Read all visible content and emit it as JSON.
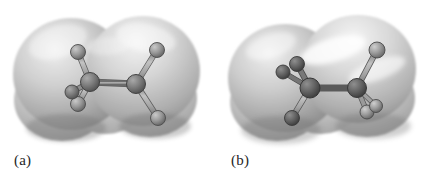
{
  "figure": {
    "background_color": "#ffffff",
    "width": 434,
    "height": 174,
    "kind": "molecular-structure-illustration"
  },
  "panels": [
    {
      "id": "a",
      "caption": "(a)",
      "conformation": "anti",
      "surface": {
        "fill_light": "#e9e9e9",
        "fill_mid": "#bdbdbd",
        "fill_dark": "#8f8f8f",
        "edge_color": "#a6a6a6",
        "lobes": [
          {
            "cx": 72,
            "cy": 75,
            "rx": 58,
            "ry": 56
          },
          {
            "cx": 142,
            "cy": 72,
            "rx": 58,
            "ry": 56
          },
          {
            "cx": 62,
            "cy": 100,
            "rx": 48,
            "ry": 40
          },
          {
            "cx": 150,
            "cy": 98,
            "rx": 46,
            "ry": 38
          },
          {
            "cx": 106,
            "cy": 86,
            "rx": 44,
            "ry": 46
          }
        ]
      },
      "model": {
        "atom_fill": "#8c8c8c",
        "atom_fill_dark": "#6e6e6e",
        "atom_edge": "#4c4c4c",
        "bond_fill": "#a8a8a8",
        "bond_edge": "#6b6b6b",
        "atoms": [
          {
            "name": "carbon-left",
            "x": 90,
            "y": 82,
            "r": 9.5,
            "shade": "dark"
          },
          {
            "name": "carbon-right",
            "x": 136,
            "y": 84,
            "r": 9.5,
            "shade": "dark"
          },
          {
            "name": "hydrogen-upper-left",
            "x": 78,
            "y": 52,
            "r": 7.5,
            "shade": "light"
          },
          {
            "name": "hydrogen-lower-left",
            "x": 78,
            "y": 104,
            "r": 7.5,
            "shade": "light"
          },
          {
            "name": "hydrogen-front-left",
            "x": 72,
            "y": 92,
            "r": 7.0,
            "shade": "dark"
          },
          {
            "name": "hydrogen-upper-right",
            "x": 157,
            "y": 50,
            "r": 7.5,
            "shade": "light"
          },
          {
            "name": "hydrogen-lower-right",
            "x": 158,
            "y": 118,
            "r": 7.5,
            "shade": "light"
          }
        ],
        "bonds": [
          {
            "name": "bond-carbon-carbon",
            "from": "carbon-left",
            "to": "carbon-right",
            "width": 5.5
          },
          {
            "name": "bond-c1-h-upper",
            "from": "carbon-left",
            "to": "hydrogen-upper-left",
            "width": 4.5
          },
          {
            "name": "bond-c1-h-lower",
            "from": "carbon-left",
            "to": "hydrogen-lower-left",
            "width": 4.5
          },
          {
            "name": "bond-c1-h-front",
            "from": "carbon-left",
            "to": "hydrogen-front-left",
            "width": 4.0
          },
          {
            "name": "bond-c2-h-upper",
            "from": "carbon-right",
            "to": "hydrogen-upper-right",
            "width": 4.5
          },
          {
            "name": "bond-c2-h-lower",
            "from": "carbon-right",
            "to": "hydrogen-lower-right",
            "width": 4.5
          }
        ]
      }
    },
    {
      "id": "b",
      "caption": "(b)",
      "conformation": "gauche",
      "surface": {
        "fill_light": "#ececec",
        "fill_mid": "#bcbcbc",
        "fill_dark": "#8d8d8d",
        "edge_color": "#a6a6a6",
        "lobes": [
          {
            "cx": 68,
            "cy": 78,
            "rx": 57,
            "ry": 54
          },
          {
            "cx": 140,
            "cy": 70,
            "rx": 58,
            "ry": 54
          },
          {
            "cx": 60,
            "cy": 102,
            "rx": 47,
            "ry": 38
          },
          {
            "cx": 150,
            "cy": 98,
            "rx": 48,
            "ry": 38
          },
          {
            "cx": 104,
            "cy": 88,
            "rx": 44,
            "ry": 44
          }
        ]
      },
      "model": {
        "atom_fill": "#8a8a8a",
        "atom_fill_dark": "#5f5f5f",
        "atom_edge": "#464646",
        "bond_fill": "#a8a8a8",
        "bond_edge": "#6b6b6b",
        "atoms": [
          {
            "name": "carbon-left",
            "x": 93,
            "y": 88,
            "r": 10.0,
            "shade": "darker"
          },
          {
            "name": "carbon-right",
            "x": 140,
            "y": 88,
            "r": 9.5,
            "shade": "darker"
          },
          {
            "name": "hydrogen-upper-left",
            "x": 80,
            "y": 64,
            "r": 7.5,
            "shade": "darker"
          },
          {
            "name": "hydrogen-back-left",
            "x": 66,
            "y": 72,
            "r": 7.0,
            "shade": "darker"
          },
          {
            "name": "hydrogen-lower-left",
            "x": 75,
            "y": 118,
            "r": 7.5,
            "shade": "dark"
          },
          {
            "name": "hydrogen-upper-right",
            "x": 160,
            "y": 50,
            "r": 8.0,
            "shade": "light"
          },
          {
            "name": "hydrogen-lower-right",
            "x": 150,
            "y": 112,
            "r": 7.0,
            "shade": "light"
          },
          {
            "name": "hydrogen-front-right",
            "x": 159,
            "y": 106,
            "r": 6.5,
            "shade": "light"
          }
        ],
        "bonds": [
          {
            "name": "bond-carbon-carbon",
            "from": "carbon-left",
            "to": "carbon-right",
            "width": 5.5
          },
          {
            "name": "bond-c1-h-upper",
            "from": "carbon-left",
            "to": "hydrogen-upper-left",
            "width": 4.5
          },
          {
            "name": "bond-c1-h-back",
            "from": "carbon-left",
            "to": "hydrogen-back-left",
            "width": 4.0
          },
          {
            "name": "bond-c1-h-lower",
            "from": "carbon-left",
            "to": "hydrogen-lower-left",
            "width": 4.5
          },
          {
            "name": "bond-c2-h-upper",
            "from": "carbon-right",
            "to": "hydrogen-upper-right",
            "width": 4.5
          },
          {
            "name": "bond-c2-h-lower",
            "from": "carbon-right",
            "to": "hydrogen-lower-right",
            "width": 4.0
          },
          {
            "name": "bond-c2-h-front",
            "from": "carbon-right",
            "to": "hydrogen-front-right",
            "width": 3.5
          }
        ]
      }
    }
  ]
}
